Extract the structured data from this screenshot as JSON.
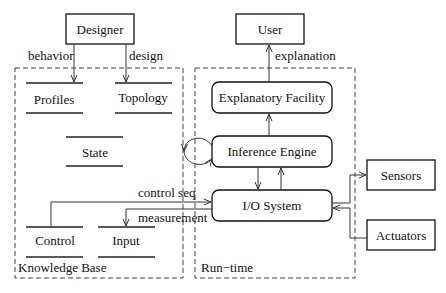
{
  "diagram": {
    "nodes": {
      "designer": "Designer",
      "user": "User",
      "profiles": "Profiles",
      "topology": "Topology",
      "state": "State",
      "control": "Control",
      "input": "Input",
      "explanatory_facility": "Explanatory Facility",
      "inference_engine": "Inference Engine",
      "io_system": "I/O System",
      "sensors": "Sensors",
      "actuators": "Actuators"
    },
    "groups": {
      "knowledge_base": "Knowledge Base",
      "run_time": "Run−time"
    },
    "edges": {
      "behavior": "behavior",
      "design": "design",
      "explanation": "explanation",
      "control_seq": "control seq",
      "measurement": "measurement"
    },
    "connections": [
      {
        "from": "Designer",
        "to": "Profiles",
        "label": "behavior"
      },
      {
        "from": "Designer",
        "to": "Topology",
        "label": "design"
      },
      {
        "from": "Explanatory Facility",
        "to": "User",
        "label": "explanation"
      },
      {
        "from": "Inference Engine",
        "to": "Explanatory Facility",
        "label": ""
      },
      {
        "from": "Inference Engine",
        "to": "I/O System",
        "label": ""
      },
      {
        "from": "I/O System",
        "to": "Inference Engine",
        "label": ""
      },
      {
        "from": "Inference Engine",
        "to": "Inference Engine",
        "label": ""
      },
      {
        "from": "Control",
        "to": "I/O System",
        "label": "control seq"
      },
      {
        "from": "I/O System",
        "to": "Input",
        "label": "measurement"
      },
      {
        "from": "I/O System",
        "to": "Sensors",
        "label": ""
      },
      {
        "from": "Actuators",
        "to": "I/O System",
        "label": ""
      }
    ]
  }
}
